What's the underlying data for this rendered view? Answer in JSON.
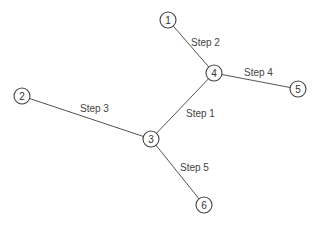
{
  "diagram": {
    "type": "graph",
    "nodes": [
      {
        "id": "1",
        "label": "1",
        "x": 168,
        "y": 20
      },
      {
        "id": "2",
        "label": "2",
        "x": 22,
        "y": 96
      },
      {
        "id": "3",
        "label": "3",
        "x": 151,
        "y": 139
      },
      {
        "id": "4",
        "label": "4",
        "x": 214,
        "y": 73
      },
      {
        "id": "5",
        "label": "5",
        "x": 298,
        "y": 89
      },
      {
        "id": "6",
        "label": "6",
        "x": 204,
        "y": 205
      }
    ],
    "edges": [
      {
        "from": "3",
        "to": "4",
        "label": "Step 1",
        "label_x": 186,
        "label_y": 113
      },
      {
        "from": "1",
        "to": "4",
        "label": "Step 2",
        "label_x": 191,
        "label_y": 42
      },
      {
        "from": "2",
        "to": "3",
        "label": "Step 3",
        "label_x": 80,
        "label_y": 108
      },
      {
        "from": "4",
        "to": "5",
        "label": "Step 4",
        "label_x": 244,
        "label_y": 72
      },
      {
        "from": "3",
        "to": "6",
        "label": "Step 5",
        "label_x": 180,
        "label_y": 167
      }
    ]
  }
}
